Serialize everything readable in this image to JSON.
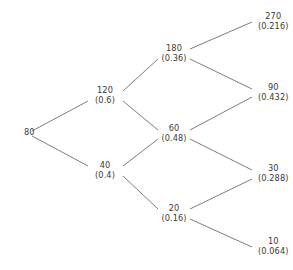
{
  "figure": {
    "type": "binomial-tree",
    "steps": 3,
    "background_color": "#ffffff",
    "line_color": "#6e6e6e",
    "text_color": "#3a3a3a"
  },
  "chart_data": {
    "type": "diagram",
    "title": "",
    "xlabel": "",
    "ylabel": "",
    "grid": false,
    "legend": null,
    "nodes": [
      {
        "id": "n0",
        "step": 0,
        "value": "80",
        "prob": "",
        "x": 24,
        "y": 133,
        "anchor": "left"
      },
      {
        "id": "n1u",
        "step": 1,
        "value": "120",
        "prob": "(0.6)",
        "x": 105,
        "y": 96,
        "anchor": "center"
      },
      {
        "id": "n1d",
        "step": 1,
        "value": "40",
        "prob": "(0.4)",
        "x": 105,
        "y": 171,
        "anchor": "center"
      },
      {
        "id": "n2uu",
        "step": 2,
        "value": "180",
        "prob": "(0.36)",
        "x": 174,
        "y": 54,
        "anchor": "center"
      },
      {
        "id": "n2ud",
        "step": 2,
        "value": "60",
        "prob": "(0.48)",
        "x": 174,
        "y": 134,
        "anchor": "center"
      },
      {
        "id": "n2dd",
        "step": 2,
        "value": "20",
        "prob": "(0.16)",
        "x": 174,
        "y": 214,
        "anchor": "center"
      },
      {
        "id": "n3a",
        "step": 3,
        "value": "270",
        "prob": "(0.216)",
        "x": 258,
        "y": 22,
        "anchor": "left"
      },
      {
        "id": "n3b",
        "step": 3,
        "value": "90",
        "prob": "(0.432)",
        "x": 258,
        "y": 93,
        "anchor": "left"
      },
      {
        "id": "n3c",
        "step": 3,
        "value": "30",
        "prob": "(0.288)",
        "x": 258,
        "y": 174,
        "anchor": "left"
      },
      {
        "id": "n3d",
        "step": 3,
        "value": "10",
        "prob": "(0.064)",
        "x": 258,
        "y": 247,
        "anchor": "left"
      }
    ],
    "edges": [
      {
        "from": "n0",
        "to": "n1u",
        "x1": 32,
        "y1": 131,
        "x2": 88,
        "y2": 101
      },
      {
        "from": "n0",
        "to": "n1d",
        "x1": 32,
        "y1": 136,
        "x2": 88,
        "y2": 166
      },
      {
        "from": "n1u",
        "to": "n2uu",
        "x1": 123,
        "y1": 91,
        "x2": 158,
        "y2": 59
      },
      {
        "from": "n1u",
        "to": "n2ud",
        "x1": 123,
        "y1": 101,
        "x2": 158,
        "y2": 130
      },
      {
        "from": "n1d",
        "to": "n2ud",
        "x1": 123,
        "y1": 166,
        "x2": 158,
        "y2": 139
      },
      {
        "from": "n1d",
        "to": "n2dd",
        "x1": 123,
        "y1": 176,
        "x2": 158,
        "y2": 209
      },
      {
        "from": "n2uu",
        "to": "n3a",
        "x1": 190,
        "y1": 49,
        "x2": 252,
        "y2": 22
      },
      {
        "from": "n2uu",
        "to": "n3b",
        "x1": 190,
        "y1": 59,
        "x2": 252,
        "y2": 89
      },
      {
        "from": "n2ud",
        "to": "n3b",
        "x1": 190,
        "y1": 130,
        "x2": 252,
        "y2": 97
      },
      {
        "from": "n2ud",
        "to": "n3c",
        "x1": 190,
        "y1": 139,
        "x2": 252,
        "y2": 170
      },
      {
        "from": "n2dd",
        "to": "n3c",
        "x1": 190,
        "y1": 209,
        "x2": 252,
        "y2": 179
      },
      {
        "from": "n2dd",
        "to": "n3d",
        "x1": 190,
        "y1": 219,
        "x2": 252,
        "y2": 247
      }
    ]
  }
}
